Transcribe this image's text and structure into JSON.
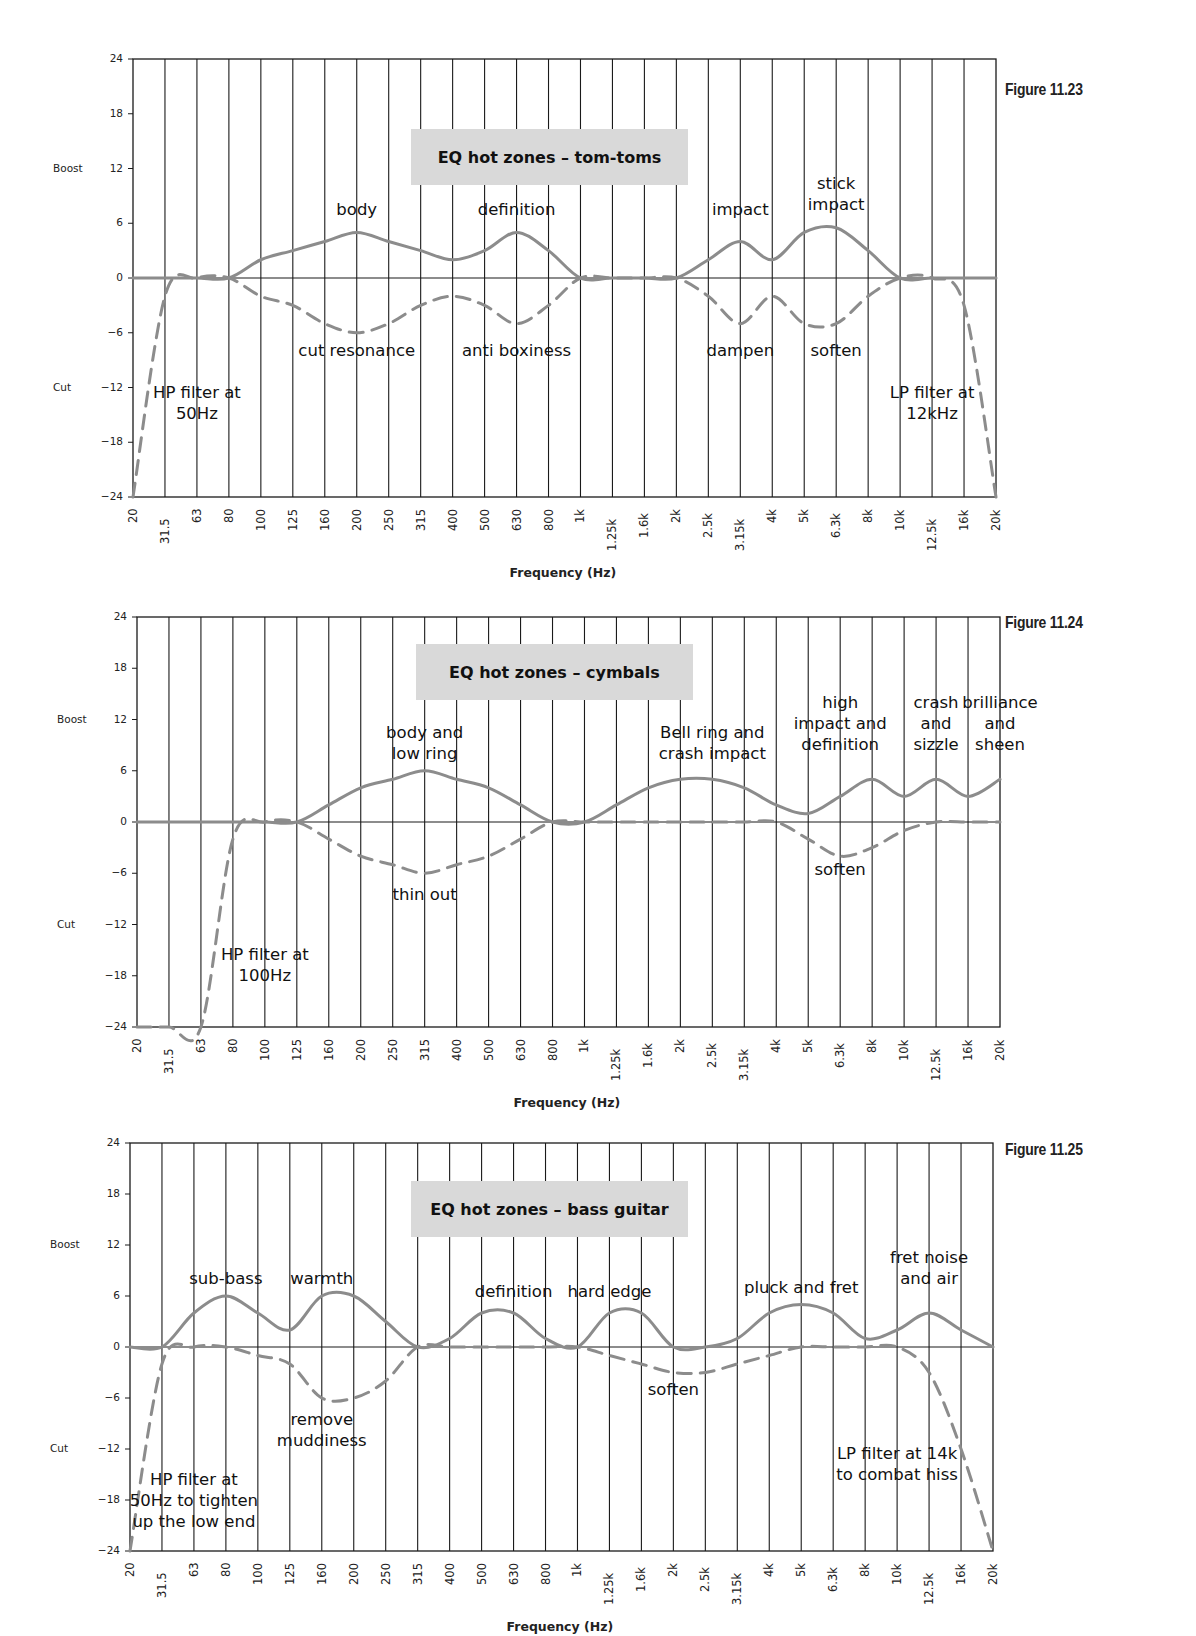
{
  "shared": {
    "boost_label": "Boost",
    "cut_label": "Cut",
    "y_ticks": [
      "24",
      "18",
      "12",
      "6",
      "0",
      "−18",
      "−24"
    ],
    "y_tick_values": [
      24,
      18,
      12,
      6,
      0,
      -6,
      -12,
      -18,
      -24
    ],
    "y_tick_labels": [
      "24",
      "18",
      "12",
      "6",
      "0",
      "−6",
      "−12",
      "−18",
      "−24"
    ],
    "x_ticks": [
      "20",
      "31.5",
      "63",
      "80",
      "100",
      "125",
      "160",
      "200",
      "250",
      "315",
      "400",
      "500",
      "630",
      "800",
      "1k",
      "1.25k",
      "1.6k",
      "2k",
      "2.5k",
      "3.15k",
      "4k",
      "5k",
      "6.3k",
      "8k",
      "10k",
      "12.5k",
      "16k",
      "20k"
    ],
    "xlabel": "Frequency (Hz)",
    "colors": {
      "curve": "#8c8c8c",
      "grid": "#1a1a1a",
      "title_box": "#d9d9d9"
    }
  },
  "figures": [
    {
      "figure_label": "Figure 11.23",
      "title": "EQ hot zones – tom-toms"
    },
    {
      "figure_label": "Figure 11.24",
      "title": "EQ hot zones – cymbals"
    },
    {
      "figure_label": "Figure 11.25",
      "title": "EQ hot zones – bass guitar"
    }
  ],
  "chart_data": [
    {
      "type": "line",
      "title": "EQ hot zones – tom-toms",
      "figure_label": "Figure 11.23",
      "xlabel": "Frequency (Hz)",
      "ylabel": "Boost / Cut (dB)",
      "ylim": [
        -24,
        24
      ],
      "grid": true,
      "categories": [
        "20",
        "31.5",
        "63",
        "80",
        "100",
        "125",
        "160",
        "200",
        "250",
        "315",
        "400",
        "500",
        "630",
        "800",
        "1k",
        "1.25k",
        "1.6k",
        "2k",
        "2.5k",
        "3.15k",
        "4k",
        "5k",
        "6.3k",
        "8k",
        "10k",
        "12.5k",
        "16k",
        "20k"
      ],
      "series": [
        {
          "name": "boost (solid)",
          "values": [
            0,
            0,
            0,
            0,
            2,
            3,
            4,
            5,
            4,
            3,
            2,
            3,
            5,
            3,
            0,
            0,
            0,
            0,
            2,
            4,
            2,
            5,
            5.5,
            3,
            0,
            0,
            0,
            0
          ]
        },
        {
          "name": "cut (dashed)",
          "values": [
            -24,
            -2,
            0,
            0,
            -2,
            -3,
            -5,
            -6,
            -5,
            -3,
            -2,
            -3,
            -5,
            -3,
            0,
            0,
            0,
            0,
            -2,
            -5,
            -2,
            -5,
            -5,
            -2,
            0,
            0,
            -3,
            -24
          ]
        }
      ],
      "annotations": [
        {
          "text": "body",
          "x": "200",
          "y": 7.5
        },
        {
          "text": "definition",
          "x": "630",
          "y": 7.5
        },
        {
          "text": "impact",
          "x": "3.15k",
          "y": 7.5
        },
        {
          "text": "stick\nimpact",
          "x": "6.3k",
          "y": 8
        },
        {
          "text": "cut resonance",
          "x": "200",
          "y": -7.5
        },
        {
          "text": "anti boxiness",
          "x": "630",
          "y": -7.5
        },
        {
          "text": "dampen",
          "x": "3.15k",
          "y": -7.5
        },
        {
          "text": "soften",
          "x": "6.3k",
          "y": -7.5
        },
        {
          "text": "HP filter at\n50Hz",
          "x": "63",
          "y": -12
        },
        {
          "text": "LP filter at\n12kHz",
          "x": "12.5k",
          "y": -12
        }
      ]
    },
    {
      "type": "line",
      "title": "EQ hot zones – cymbals",
      "figure_label": "Figure 11.24",
      "xlabel": "Frequency (Hz)",
      "ylabel": "Boost / Cut (dB)",
      "ylim": [
        -24,
        24
      ],
      "grid": true,
      "categories": [
        "20",
        "31.5",
        "63",
        "80",
        "100",
        "125",
        "160",
        "200",
        "250",
        "315",
        "400",
        "500",
        "630",
        "800",
        "1k",
        "1.25k",
        "1.6k",
        "2k",
        "2.5k",
        "3.15k",
        "4k",
        "5k",
        "6.3k",
        "8k",
        "10k",
        "12.5k",
        "16k",
        "20k"
      ],
      "series": [
        {
          "name": "boost (solid)",
          "values": [
            0,
            0,
            0,
            0,
            0,
            0,
            2,
            4,
            5,
            6,
            5,
            4,
            2,
            0,
            0,
            2,
            4,
            5,
            5,
            4,
            2,
            1,
            3,
            5,
            3,
            5,
            3,
            5
          ]
        },
        {
          "name": "cut (dashed)",
          "values": [
            -24,
            -24,
            -24,
            -2,
            0,
            0,
            -2,
            -4,
            -5,
            -6,
            -5,
            -4,
            -2,
            0,
            0,
            0,
            0,
            0,
            0,
            0,
            0,
            -2,
            -4,
            -3,
            -1,
            0,
            0,
            0
          ]
        }
      ],
      "annotations": [
        {
          "text": "body and\nlow ring",
          "x": "315",
          "y": 8
        },
        {
          "text": "thin out",
          "x": "315",
          "y": -8
        },
        {
          "text": "Bell ring and\ncrash impact",
          "x": "2.5k",
          "y": 8
        },
        {
          "text": "high\nimpact and\ndefinition",
          "x": "6.3k",
          "y": 9
        },
        {
          "text": "crash\nand\nsizzle",
          "x": "12.5k",
          "y": 9
        },
        {
          "text": "brilliance\nand\nsheen",
          "x": "20k",
          "y": 9
        },
        {
          "text": "soften",
          "x": "6.3k",
          "y": -5
        },
        {
          "text": "HP filter at\n100Hz",
          "x": "100",
          "y": -15
        }
      ]
    },
    {
      "type": "line",
      "title": "EQ hot zones – bass guitar",
      "figure_label": "Figure 11.25",
      "xlabel": "Frequency (Hz)",
      "ylabel": "Boost / Cut (dB)",
      "ylim": [
        -24,
        24
      ],
      "grid": true,
      "categories": [
        "20",
        "31.5",
        "63",
        "80",
        "100",
        "125",
        "160",
        "200",
        "250",
        "315",
        "400",
        "500",
        "630",
        "800",
        "1k",
        "1.25k",
        "1.6k",
        "2k",
        "2.5k",
        "3.15k",
        "4k",
        "5k",
        "6.3k",
        "8k",
        "10k",
        "12.5k",
        "16k",
        "20k"
      ],
      "series": [
        {
          "name": "boost (solid)",
          "values": [
            0,
            0,
            4,
            6,
            4,
            2,
            6,
            6,
            3,
            0,
            1,
            4,
            4,
            1,
            0,
            4,
            4,
            0,
            0,
            1,
            4,
            5,
            4,
            1,
            2,
            4,
            2,
            0
          ]
        },
        {
          "name": "cut (dashed)",
          "values": [
            -24,
            -2,
            0,
            0,
            -1,
            -2,
            -6,
            -6,
            -4,
            0,
            0,
            0,
            0,
            0,
            0,
            -1,
            -2,
            -3,
            -3,
            -2,
            -1,
            0,
            0,
            0,
            0,
            -3,
            -12,
            -24
          ]
        }
      ],
      "annotations": [
        {
          "text": "sub-bass",
          "x": "80",
          "y": 8
        },
        {
          "text": "warmth",
          "x": "160",
          "y": 8
        },
        {
          "text": "definition",
          "x": "630",
          "y": 6.5
        },
        {
          "text": "hard edge",
          "x": "1.25k",
          "y": 6.5
        },
        {
          "text": "pluck and fret",
          "x": "5k",
          "y": 7
        },
        {
          "text": "fret noise\nand air",
          "x": "12.5k",
          "y": 8
        },
        {
          "text": "remove\nmuddiness",
          "x": "160",
          "y": -8
        },
        {
          "text": "soften",
          "x": "2k",
          "y": -4.5
        },
        {
          "text": "HP filter at\n50Hz to tighten\nup the low end",
          "x": "63",
          "y": -15
        },
        {
          "text": "LP filter at 14k\nto combat hiss",
          "x": "10k",
          "y": -12
        }
      ]
    }
  ]
}
